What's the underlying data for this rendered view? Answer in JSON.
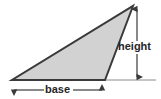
{
  "figure": {
    "type": "geometry-diagram",
    "canvas": {
      "width": 161,
      "height": 99,
      "background": "#ffffff"
    },
    "shape": {
      "name": "triangle",
      "fill_color": "#d2d2d2",
      "stroke_color": "#3a3a3a",
      "stroke_width": 2,
      "vertices": [
        {
          "name": "left-base-vertex",
          "x": 12,
          "y": 80
        },
        {
          "name": "right-base-vertex",
          "x": 105,
          "y": 80
        },
        {
          "name": "apex-vertex",
          "x": 133,
          "y": 6
        }
      ]
    },
    "baseline": {
      "name": "extended-baseline",
      "color": "#8c8c8c",
      "x1": 11,
      "y1": 80,
      "x2": 156,
      "y2": 80
    },
    "dimensions": [
      {
        "id": "height",
        "label": "height",
        "orientation": "vertical",
        "color": "#3a3a3a",
        "x": 137,
        "y_start": 6,
        "y_end": 80,
        "label_x": 118,
        "label_y": 47,
        "arrowheads": "both"
      },
      {
        "id": "base",
        "label": "base",
        "orientation": "horizontal",
        "color": "#3a3a3a",
        "y": 90,
        "x_start": 11,
        "x_end": 105,
        "label_x": 58,
        "label_y": 90,
        "arrowheads": "both"
      }
    ]
  }
}
